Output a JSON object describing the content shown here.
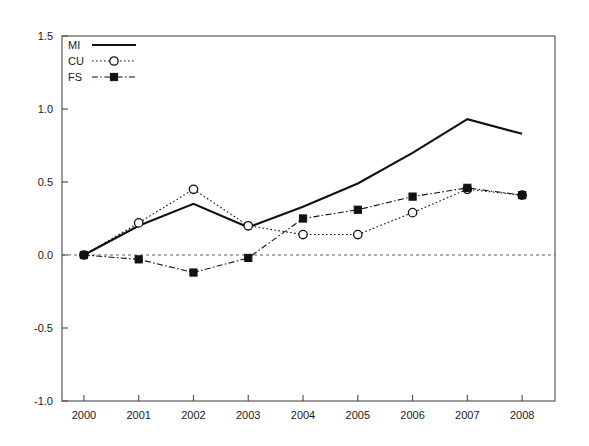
{
  "chart_data": {
    "type": "line",
    "title": "",
    "subtitle": "",
    "xlabel": "",
    "ylabel": "",
    "categories": [
      "2000",
      "2001",
      "2002",
      "2003",
      "2004",
      "2005",
      "2006",
      "2007",
      "2008"
    ],
    "x": [
      2000,
      2001,
      2002,
      2003,
      2004,
      2005,
      2006,
      2007,
      2008
    ],
    "xlim": [
      1999.6,
      2008.6
    ],
    "ylim": [
      -1.0,
      1.5
    ],
    "yticks": [
      "1.5",
      "1.0",
      "0.5",
      "0.0",
      "-0.5",
      "-1.0"
    ],
    "ytick_values": [
      1.5,
      1.0,
      0.5,
      0.0,
      -0.5,
      -1.0
    ],
    "xticks": [
      "2000",
      "2001",
      "2002",
      "2003",
      "2004",
      "2005",
      "2006",
      "2007",
      "2008"
    ],
    "grid": false,
    "zero_reference_line": 0.0,
    "legend_position": "top-left",
    "series": [
      {
        "name": "MI",
        "style": "solid",
        "marker": "none",
        "values": [
          0.0,
          0.2,
          0.35,
          0.19,
          0.33,
          0.49,
          0.7,
          0.93,
          0.83
        ]
      },
      {
        "name": "CU",
        "style": "dotted",
        "marker": "open-circle",
        "values": [
          0.0,
          0.22,
          0.45,
          0.2,
          0.14,
          0.14,
          0.29,
          0.45,
          0.41
        ]
      },
      {
        "name": "FS",
        "style": "dash-dot",
        "marker": "filled-square",
        "values": [
          0.0,
          -0.03,
          -0.12,
          -0.02,
          0.25,
          0.31,
          0.4,
          0.46,
          0.41
        ]
      }
    ]
  },
  "colors": {
    "axis": "#4a4a4a",
    "series": "#111111",
    "background": "#ffffff",
    "zero_line": "#5a5a5a"
  }
}
